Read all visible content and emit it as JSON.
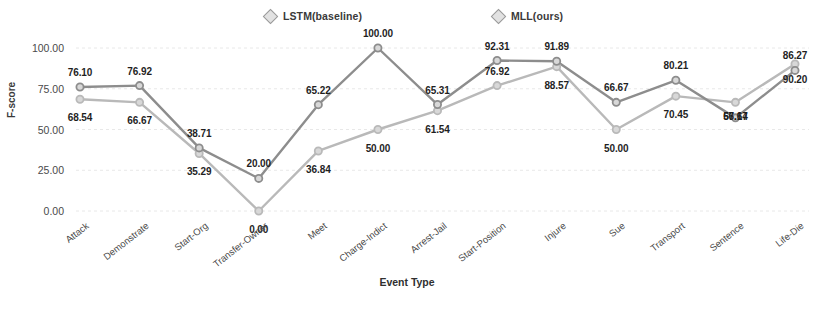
{
  "chart_data": {
    "type": "line",
    "title": "",
    "xlabel": "Event Type",
    "ylabel": "F-score",
    "ylim": [
      0,
      100
    ],
    "yticks": [
      "0.00",
      "25.00",
      "50.00",
      "75.00",
      "100.00"
    ],
    "grid": true,
    "legend_position": "top",
    "categories": [
      "Attack",
      "Demonstrate",
      "Start-Org",
      "Transfer-Owner",
      "Meet",
      "Charge-Indict",
      "Arrest-Jail",
      "Start-Position",
      "Injure",
      "Sue",
      "Transport",
      "Sentence",
      "Life-Die"
    ],
    "series": [
      {
        "name": "LSTM(baseline)",
        "color": "#b9b9b9",
        "values": [
          68.54,
          66.67,
          35.29,
          0.0,
          36.84,
          50.0,
          61.54,
          76.92,
          88.57,
          50.0,
          70.45,
          66.67,
          90.2
        ],
        "labels": [
          "68.54",
          "66.67",
          "35.29",
          "0.00",
          "36.84",
          "50.00",
          "61.54",
          "76.92",
          "88.57",
          "50.00",
          "70.45",
          "66.67",
          "90.20"
        ]
      },
      {
        "name": "MLL(ours)",
        "color": "#8d8d8d",
        "values": [
          76.1,
          76.92,
          38.71,
          20.0,
          65.22,
          100.0,
          65.31,
          92.31,
          91.89,
          66.67,
          80.21,
          57.14,
          86.27
        ],
        "labels": [
          "76.10",
          "76.92",
          "38.71",
          "20.00",
          "65.22",
          "100.00",
          "65.31",
          "92.31",
          "91.89",
          "66.67",
          "80.21",
          "57.14",
          "86.27"
        ]
      }
    ]
  },
  "legend": {
    "entries": [
      {
        "label": "LSTM(baseline)"
      },
      {
        "label": "MLL(ours)"
      }
    ]
  }
}
